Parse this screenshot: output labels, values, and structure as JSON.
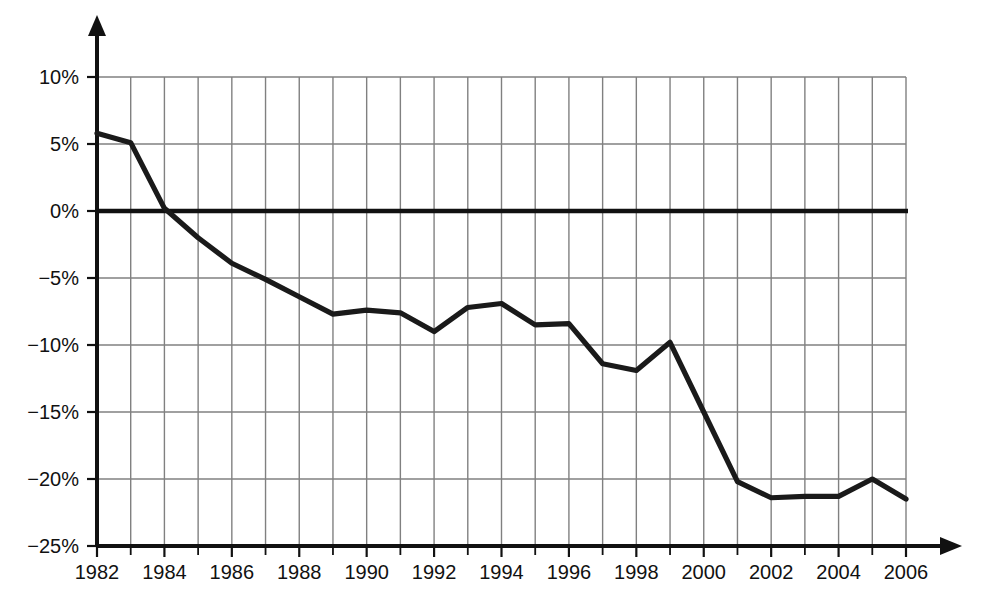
{
  "chart_data": {
    "type": "line",
    "title": "",
    "subtitle": "",
    "xlabel": "",
    "ylabel": "",
    "xlim": [
      1982,
      2006
    ],
    "ylim": [
      -25,
      10
    ],
    "grid": true,
    "grid_x_step": 1,
    "grid_y_step": 5,
    "legend": "none",
    "zero_line": true,
    "x": [
      1982,
      1983,
      1984,
      1985,
      1986,
      1987,
      1988,
      1989,
      1990,
      1991,
      1992,
      1993,
      1994,
      1995,
      1996,
      1997,
      1998,
      1999,
      2000,
      2001,
      2002,
      2003,
      2004,
      2005,
      2006
    ],
    "values": [
      5.8,
      5.1,
      0.2,
      -2.0,
      -3.9,
      -5.1,
      -6.4,
      -7.7,
      -7.4,
      -7.6,
      -9.0,
      -7.2,
      -6.9,
      -8.5,
      -8.4,
      -11.4,
      -11.9,
      -9.8,
      -15.0,
      -20.2,
      -21.4,
      -21.3,
      -21.3,
      -20.0,
      -21.5
    ],
    "series": [
      {
        "name": "series-1",
        "color": "#1a1a1a",
        "values": [
          5.8,
          5.1,
          0.2,
          -2.0,
          -3.9,
          -5.1,
          -6.4,
          -7.7,
          -7.4,
          -7.6,
          -9.0,
          -7.2,
          -6.9,
          -8.5,
          -8.4,
          -11.4,
          -11.9,
          -9.8,
          -15.0,
          -20.2,
          -21.4,
          -21.3,
          -21.3,
          -20.0,
          -21.5
        ]
      }
    ],
    "y_ticks": [
      10,
      5,
      0,
      -5,
      -10,
      -15,
      -20,
      -25
    ],
    "y_tick_labels": [
      "10%",
      "5%",
      "0%",
      "−5%",
      "−10%",
      "−15%",
      "−20%",
      "−25%"
    ],
    "x_ticks": [
      1982,
      1984,
      1986,
      1988,
      1990,
      1992,
      1994,
      1996,
      1998,
      2000,
      2002,
      2004,
      2006
    ],
    "x_tick_labels": [
      "1982",
      "1984",
      "1986",
      "1988",
      "1990",
      "1992",
      "1994",
      "1996",
      "1998",
      "2000",
      "2002",
      "2004",
      "2006"
    ],
    "x_minor_ticks": [
      1983,
      1985,
      1987,
      1989,
      1991,
      1993,
      1995,
      1997,
      1999,
      2001,
      2003,
      2005
    ]
  },
  "style": {
    "background": "#ffffff",
    "grid_color": "#808080",
    "axis_color": "#111111",
    "line_color": "#1a1a1a",
    "zero_line_color": "#111111",
    "text_color": "#111111"
  }
}
